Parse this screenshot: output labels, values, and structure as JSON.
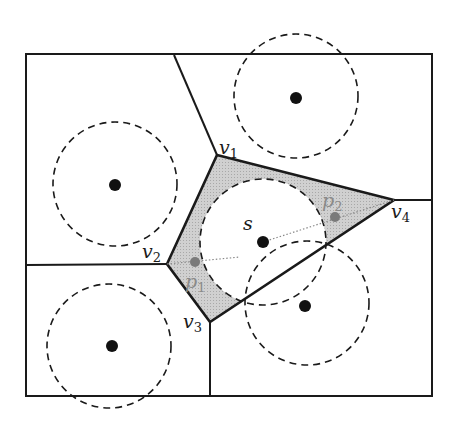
{
  "diagram": {
    "colors": {
      "edge": "#1a1a1a",
      "shaded_region": "#c8c8c8",
      "site": "#111111",
      "highlight_point": "#7a7a7a",
      "dotted_line": "#8a8a8a",
      "background": "#ffffff"
    },
    "labels": {
      "v1": "v",
      "v1_sub": "1",
      "v2": "v",
      "v2_sub": "2",
      "v3": "v",
      "v3_sub": "3",
      "v4": "v",
      "v4_sub": "4",
      "s": "s",
      "p1": "p",
      "p1_sub": "1",
      "p2": "p",
      "p2_sub": "2"
    },
    "vertices": [
      {
        "name": "v1",
        "x": 217,
        "y": 155
      },
      {
        "name": "v2",
        "x": 167,
        "y": 264
      },
      {
        "name": "v3",
        "x": 210,
        "y": 322
      },
      {
        "name": "v4",
        "x": 394,
        "y": 200
      }
    ],
    "sites": [
      {
        "name": "s",
        "x": 263,
        "y": 242
      },
      {
        "name": "top-right",
        "x": 296,
        "y": 98
      },
      {
        "name": "left",
        "x": 115,
        "y": 185
      },
      {
        "name": "bottom-left",
        "x": 112,
        "y": 346
      },
      {
        "name": "bottom-right",
        "x": 305,
        "y": 306
      }
    ],
    "points": [
      {
        "name": "p1",
        "x": 195,
        "y": 262
      },
      {
        "name": "p2",
        "x": 335,
        "y": 217
      }
    ]
  }
}
